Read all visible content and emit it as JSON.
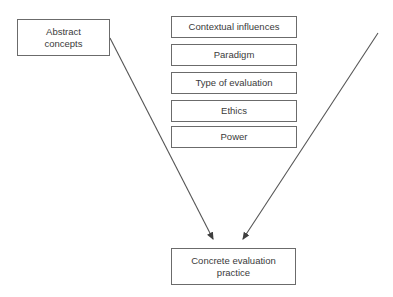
{
  "diagram": {
    "title_text": "",
    "background_color": "#ffffff",
    "border_color": "#6b6b6b",
    "text_color": "#3a3a3a",
    "arrow_color": "#555555",
    "left_node": {
      "label": "Abstract\nconcepts",
      "icon": "rectangle-node"
    },
    "middle_nodes": [
      {
        "label": "Contextual influences"
      },
      {
        "label": "Paradigm"
      },
      {
        "label": "Type of evaluation"
      },
      {
        "label": "Ethics"
      },
      {
        "label": "Power"
      }
    ],
    "bottom_node": {
      "label": "Concrete evaluation\npractice",
      "icon": "rectangle-node"
    },
    "arrows": [
      {
        "name": "arrow-left-to-practice",
        "icon": "arrow-diagonal-down-right-icon",
        "from_x": 110,
        "from_y": 38,
        "to_x": 213,
        "to_y": 239
      },
      {
        "name": "arrow-right-to-practice",
        "icon": "arrow-diagonal-down-left-icon",
        "from_x": 378,
        "from_y": 33,
        "to_x": 243,
        "to_y": 239
      }
    ]
  }
}
